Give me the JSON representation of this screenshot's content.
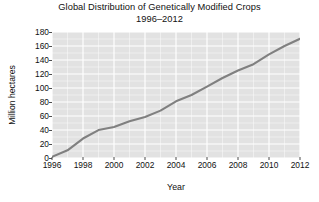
{
  "chart_data": {
    "type": "line",
    "title": "Global Distribution of Genetically Modified Crops",
    "subtitle": "1996–2012",
    "xlabel": "Year",
    "ylabel": "Million hectares",
    "xlim": [
      1996,
      2012
    ],
    "ylim": [
      0,
      180
    ],
    "xticks": [
      1996,
      1998,
      2000,
      2002,
      2004,
      2006,
      2008,
      2010,
      2012
    ],
    "yticks": [
      0,
      20,
      40,
      60,
      80,
      100,
      120,
      140,
      160,
      180
    ],
    "grid": true,
    "legend": false,
    "legend_position": "none",
    "line_color": "#808080",
    "panel_color": "#e2e2e2",
    "gridline_color": "#ffffff",
    "x": [
      1996,
      1997,
      1998,
      1999,
      2000,
      2001,
      2002,
      2003,
      2004,
      2005,
      2006,
      2007,
      2008,
      2009,
      2010,
      2011,
      2012
    ],
    "values": [
      1.7,
      11.0,
      27.8,
      39.9,
      44.2,
      52.6,
      58.7,
      67.7,
      81.0,
      90.0,
      102.0,
      114.3,
      125.0,
      134.0,
      148.0,
      160.0,
      170.3
    ],
    "series": [
      {
        "name": "Global GM crop area",
        "values": [
          1.7,
          11.0,
          27.8,
          39.9,
          44.2,
          52.6,
          58.7,
          67.7,
          81.0,
          90.0,
          102.0,
          114.3,
          125.0,
          134.0,
          148.0,
          160.0,
          170.3
        ]
      }
    ]
  },
  "axis": {
    "ytick_labels": [
      "180",
      "160",
      "140",
      "120",
      "100",
      "80",
      "60",
      "40",
      "20",
      "0"
    ],
    "xtick_labels": [
      "1996",
      "1998",
      "2000",
      "2002",
      "2004",
      "2006",
      "2008",
      "2010",
      "2012"
    ]
  }
}
